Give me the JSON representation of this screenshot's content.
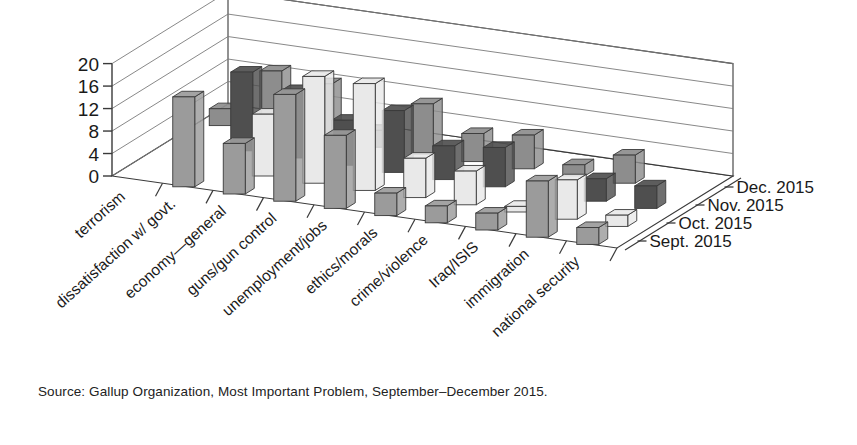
{
  "caption": "Source: Gallup Organization, Most Important Problem, September–December 2015.",
  "axis": {
    "y_ticks": [
      "0",
      "4",
      "8",
      "12",
      "16",
      "20"
    ],
    "y_values": [
      0,
      4,
      8,
      12,
      16,
      20
    ]
  },
  "series_labels": [
    "Dec. 2015",
    "Nov. 2015",
    "Oct. 2015",
    "Sept. 2015"
  ],
  "colors": {
    "dec_2015": "#9b9b9b",
    "nov_2015": "#e9e9e9",
    "oct_2015": "#4f4f4f",
    "sept_2015": "#8d8d8d",
    "outline": "#3a3a3a",
    "grid": "#7a7a7a",
    "background": "#ffffff",
    "text": "#1a1a1a"
  },
  "chart_data": {
    "type": "bar",
    "title": "",
    "subtitle": "",
    "xlabel": "",
    "ylabel": "",
    "ylim": [
      0,
      20
    ],
    "grid": true,
    "legend_position": "right",
    "projection": "3d",
    "categories": [
      "terrorism",
      "dissatisfaction w/ govt.",
      "economy—general",
      "guns/gun control",
      "unemployment/jobs",
      "ethics/morals",
      "crime/violence",
      "Iraq/ISIS",
      "immigration",
      "national security"
    ],
    "series": [
      {
        "name": "Dec. 2015",
        "values": [
          0,
          16,
          9,
          19,
          13,
          4,
          3,
          3,
          10,
          3
        ]
      },
      {
        "name": "Nov. 2015",
        "values": [
          0,
          0,
          11,
          19,
          19,
          7,
          6,
          1,
          7,
          2
        ]
      },
      {
        "name": "Oct. 2015",
        "values": [
          0,
          14,
          12,
          8,
          11,
          6,
          7,
          0,
          4,
          4
        ]
      },
      {
        "name": "Sept. 2015",
        "values": [
          3,
          11,
          10,
          3,
          9,
          5,
          6,
          2,
          5,
          0
        ]
      }
    ],
    "source": "Source: Gallup Organization, Most Important Problem, September–December 2015."
  }
}
